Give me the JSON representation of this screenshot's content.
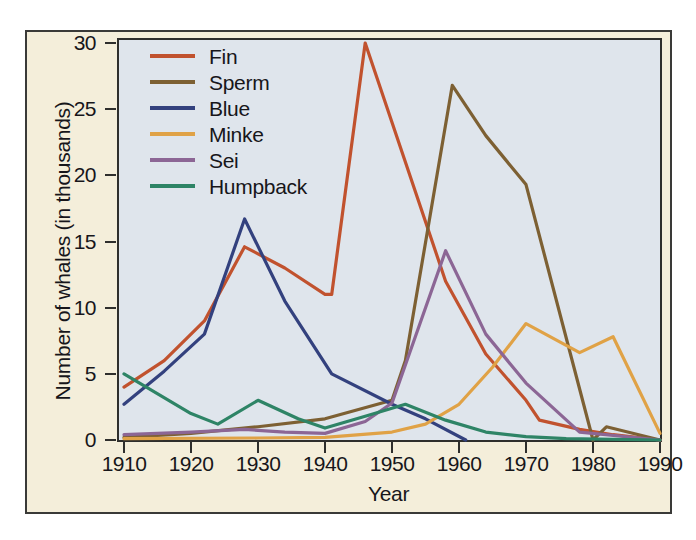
{
  "chart_data": {
    "type": "line",
    "title": "",
    "xlabel": "Year",
    "ylabel": "Number of whales (in thousands)",
    "xlim": [
      1910,
      1990
    ],
    "ylim": [
      0,
      30
    ],
    "xticks": [
      1910,
      1920,
      1930,
      1940,
      1950,
      1960,
      1970,
      1980,
      1990
    ],
    "yticks": [
      0,
      5,
      10,
      15,
      20,
      25,
      30
    ],
    "grid": false,
    "legend_position": "top-left inside plot",
    "series": [
      {
        "name": "Fin",
        "color": "#c1522e",
        "points": [
          [
            1910,
            4.0
          ],
          [
            1916,
            6.0
          ],
          [
            1922,
            9.0
          ],
          [
            1928,
            14.6
          ],
          [
            1934,
            13.0
          ],
          [
            1940,
            11.0
          ],
          [
            1941,
            11.0
          ],
          [
            1946,
            30.0
          ],
          [
            1958,
            12.0
          ],
          [
            1964,
            6.5
          ],
          [
            1970,
            3.0
          ],
          [
            1972,
            1.5
          ],
          [
            1978,
            0.8
          ],
          [
            1983,
            0.4
          ],
          [
            1990,
            0.0
          ]
        ]
      },
      {
        "name": "Sperm",
        "color": "#7d6033",
        "points": [
          [
            1910,
            0.2
          ],
          [
            1920,
            0.5
          ],
          [
            1930,
            1.0
          ],
          [
            1940,
            1.6
          ],
          [
            1950,
            3.0
          ],
          [
            1952,
            6.0
          ],
          [
            1959,
            26.8
          ],
          [
            1964,
            23.0
          ],
          [
            1970,
            19.3
          ],
          [
            1980,
            0.0
          ],
          [
            1982,
            1.0
          ],
          [
            1990,
            0.0
          ]
        ]
      },
      {
        "name": "Blue",
        "color": "#33417e",
        "points": [
          [
            1910,
            2.7
          ],
          [
            1916,
            5.2
          ],
          [
            1922,
            8.0
          ],
          [
            1928,
            16.7
          ],
          [
            1934,
            10.5
          ],
          [
            1941,
            5.0
          ],
          [
            1950,
            2.7
          ],
          [
            1955,
            1.6
          ],
          [
            1961,
            0.0
          ]
        ]
      },
      {
        "name": "Minke",
        "color": "#e0a246",
        "points": [
          [
            1910,
            0.1
          ],
          [
            1930,
            0.15
          ],
          [
            1940,
            0.2
          ],
          [
            1950,
            0.6
          ],
          [
            1955,
            1.2
          ],
          [
            1960,
            2.7
          ],
          [
            1965,
            5.5
          ],
          [
            1970,
            8.8
          ],
          [
            1978,
            6.6
          ],
          [
            1983,
            7.8
          ],
          [
            1990,
            0.5
          ]
        ]
      },
      {
        "name": "Sei",
        "color": "#8c6695",
        "points": [
          [
            1910,
            0.4
          ],
          [
            1920,
            0.6
          ],
          [
            1928,
            0.8
          ],
          [
            1934,
            0.6
          ],
          [
            1940,
            0.5
          ],
          [
            1946,
            1.4
          ],
          [
            1950,
            2.8
          ],
          [
            1958,
            14.3
          ],
          [
            1964,
            8.0
          ],
          [
            1970,
            4.3
          ],
          [
            1978,
            0.6
          ],
          [
            1990,
            0.0
          ]
        ]
      },
      {
        "name": "Humpback",
        "color": "#2e8466",
        "points": [
          [
            1910,
            5.0
          ],
          [
            1920,
            2.0
          ],
          [
            1924,
            1.2
          ],
          [
            1930,
            3.0
          ],
          [
            1936,
            1.6
          ],
          [
            1940,
            0.9
          ],
          [
            1946,
            1.8
          ],
          [
            1952,
            2.7
          ],
          [
            1958,
            1.5
          ],
          [
            1964,
            0.6
          ],
          [
            1970,
            0.25
          ],
          [
            1976,
            0.1
          ],
          [
            1990,
            0.0
          ]
        ]
      }
    ]
  },
  "legend": {
    "items": [
      {
        "label": "Fin",
        "color": "#c1522e"
      },
      {
        "label": "Sperm",
        "color": "#7d6033"
      },
      {
        "label": "Blue",
        "color": "#33417e"
      },
      {
        "label": "Minke",
        "color": "#e0a246"
      },
      {
        "label": "Sei",
        "color": "#8c6695"
      },
      {
        "label": "Humpback",
        "color": "#2e8466"
      }
    ]
  },
  "axes": {
    "y_title": "Number of whales (in thousands)",
    "x_title": "Year",
    "y_tick_labels": [
      "0",
      "5",
      "10",
      "15",
      "20",
      "25",
      "30"
    ],
    "x_tick_labels": [
      "1910",
      "1920",
      "1930",
      "1940",
      "1950",
      "1960",
      "1970",
      "1980",
      "1990"
    ]
  },
  "colors": {
    "panel_background": "#dfe5ec",
    "mat_background": "#f4eeda",
    "frame": "#2e2e2c",
    "text": "#17161a"
  }
}
